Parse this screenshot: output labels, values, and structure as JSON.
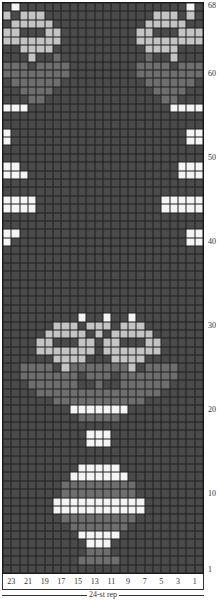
{
  "chart_data": {
    "type": "table",
    "xlabel": "24-st rep",
    "ylabel": "",
    "columns": 24,
    "rows": 68,
    "legend": {
      "D": "dark grey",
      "M": "medium grey",
      "L": "light grey",
      "W": "white"
    },
    "colors": {
      "D": "#4a4a4a",
      "M": "#6e6e6e",
      "L": "#c4c4c4",
      "W": "#f4f4f4"
    },
    "x_tick_labels": [
      "23",
      "21",
      "19",
      "17",
      "15",
      "13",
      "11",
      "9",
      "7",
      "5",
      "3",
      "1"
    ],
    "y_tick_labels": [
      {
        "row": 1,
        "label": "1"
      },
      {
        "row": 10,
        "label": "10"
      },
      {
        "row": 20,
        "label": "20"
      },
      {
        "row": 30,
        "label": "30"
      },
      {
        "row": 40,
        "label": "40"
      },
      {
        "row": 50,
        "label": "50"
      },
      {
        "row": 60,
        "label": "60"
      },
      {
        "row": 68,
        "label": "68"
      }
    ],
    "grid_rows_top_to_bottom": [
      "DWDDDDDDDDDDDDDDDDDDDDWD",
      "LDLLLDDDDDDDDDDDDDLLLDLD",
      "DLLLLLDDDDDDDDDDDLLLLLDD",
      "LLDDDLLDDDDDDDDDLLDDDLLL",
      "LLLLLLLDDDDDDDDDLLLLLLLL",
      "DDLLLLDDDDDDDDDDDLLLLDDD",
      "DDDLDDMDDDDDDDDDDMDDLDDD",
      "MMMDMMMMDDDDDDDDMMMMDMMM",
      "MMMMMMMMDDDDDDDDMMMMMMMM",
      "DMMMMMMDDDDDDDDDDMMMMMMD",
      "DDMMMMDDDDDDDDDDDDMMMMDD",
      "DDDMMDDDDDDDDDDDDDDMMDDD",
      "WWWDDDDDDDDDDDDDDDDDWWWW",
      "DDDDDDDDDDDDDDDDDDDDDDDD",
      "DDDDDDDDDDDDDDDDDDDDDDDD",
      "WDDDDDDDDDDDDDDDDDDDDDWW",
      "WDDDDDDDDDDDDDDDDDDDDDWW",
      "DDDDDDDDDDDDDDDDDDDDDDDD",
      "DDDDDDDDDDDDDDDDDDDDDDDD",
      "WWDDDDDDDDDDDDDDDDDDDWWW",
      "WWWDDDDDDDDDDDDDDDDDDWWW",
      "DDDDDDDDDDDDDDDDDDDDDDDD",
      "DDDDDDDDDDDDDDDDDDDDDDDD",
      "WWWWDDDDDDDDDDDDDDDWWWWW",
      "WWWWDDDDDDDDDDDDDDDWWWWW",
      "DDDDDDDDDDDDDDDDDDDDDDDD",
      "DDDDDDDDDDDDDDDDDDDDDDDD",
      "WWDDDDDDDDDDDDDDDDDDDDWW",
      "WDDDDDDDDDDDDDDDDDDDDDWW",
      "DDDDDDDDDDDDDDDDDDDDDDDD",
      "DDDDDDDDDDDDDDDDDDDDDDDD",
      "DDDDDDDDDDDDDDDDDDDDDDDD",
      "DDDDDDDDDDDDDDDDDDDDDDDD",
      "DDDDDDDDDDDDDDDDDDDDDDDD",
      "DDDDDDDDDDDDDDDDDDDDDDDD",
      "DDDDDDDDDDDDDDDDDDDDDDDD",
      "DDDDDDDDDDDDDDDDDDDDDDDD",
      "DDDDDDDDDWDDWDDWDDDDDDDD",
      "DDDDDDLLLDLLLDLLLDDDDDDD",
      "DDDDDLLLLLDLDLLLLLDDDDDD",
      "DDDDLLDDDLLDLLDDDLLDDDDD",
      "DDDDLLLLLLLDLLLLLLLDDDDD",
      "DDDDDDLLLLDDDLLLLDDDDDDD",
      "DDMMMMDLMMMMMMMLDMMMMDDD",
      "DDMMMMMMMDMMMDMMMMMMMDDD",
      "DDDMMMMMMDDMDDMMMMMMDDDD",
      "DDDDMMMMMMMMMMMMMMMDDDDD",
      "DDDDDDMMMMMMMMMMMDDDDDDD",
      "DDDDDDDDWWWWWWWDDDDDDDDD",
      "DDDDDDDDDMMMMMDDDDDDDDDD",
      "DDDDDDDDDDDDDDDDDDDDDDDD",
      "DDDDDDDDDDWWWDDDDDDDDDDD",
      "DDDDDDDDDDWWWDDDDDDDDDDD",
      "DDDDDDDDDDDDDDDDDDDDDDDD",
      "DDDDDDDDDDDDDDDDDDDDDDDD",
      "DDDDDDDDDWWWWWDDDDDDDDDD",
      "DDDDDDDDWWWWWWWDDDDDDDDD",
      "DDDDDDDMMMMMMMMMDDDDDDDD",
      "DDDDDDDMMMMMMMMMDDDDDDDD",
      "DDDDDDWWWWWWWWWWWDDDDDDD",
      "DDDDDDWWWWWWWWWWWDDDDDDD",
      "DDDDDDDMMMMMMMMMDDDDDDDD",
      "DDDDDDDDMMMMMMMDDDDDDDDD",
      "DDDDDDDDDWWWWWDDDDDDDDDD",
      "DDDDDDDDDDWWWDDDDDDDDDDD",
      "DDDDDDDDDDMMMDDDDDDDDDDD",
      "DDDDDDDDDMMMMMDDDDDDDDDD",
      "DDDDDDDDDDDDDDDDDDDDDDDD"
    ]
  },
  "labels": {
    "rep": "24-st rep"
  }
}
